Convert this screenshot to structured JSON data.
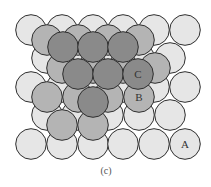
{
  "figure": {
    "caption": "(c)",
    "radius": 15.3,
    "stroke": "#2e2e2e",
    "layers": [
      {
        "name": "A",
        "color": "#e6e6e6",
        "circles": [
          [
            31,
            30
          ],
          [
            62,
            30
          ],
          [
            93,
            30
          ],
          [
            123,
            30
          ],
          [
            154,
            30
          ],
          [
            185,
            30
          ],
          [
            47,
            58
          ],
          [
            77,
            58
          ],
          [
            108,
            58
          ],
          [
            139,
            58
          ],
          [
            170,
            58
          ],
          [
            31,
            87
          ],
          [
            62,
            87
          ],
          [
            93,
            87
          ],
          [
            123,
            87
          ],
          [
            154,
            87
          ],
          [
            185,
            87
          ],
          [
            47,
            115
          ],
          [
            77,
            115
          ],
          [
            108,
            115
          ],
          [
            139,
            115
          ],
          [
            170,
            115
          ],
          [
            31,
            144
          ],
          [
            62,
            144
          ],
          [
            93,
            144
          ],
          [
            123,
            144
          ],
          [
            154,
            144
          ],
          [
            185,
            144
          ]
        ],
        "label": {
          "text": "A",
          "x": 185,
          "y": 148
        }
      },
      {
        "name": "B",
        "color": "#b4b4b4",
        "circles": [
          [
            47,
            40
          ],
          [
            78,
            40
          ],
          [
            108,
            40
          ],
          [
            139,
            40
          ],
          [
            62,
            68
          ],
          [
            93,
            68
          ],
          [
            123,
            68
          ],
          [
            155,
            68
          ],
          [
            47,
            97
          ],
          [
            78,
            97
          ],
          [
            108,
            97
          ],
          [
            139,
            97
          ],
          [
            62,
            125
          ],
          [
            93,
            125
          ]
        ],
        "label": {
          "text": "B",
          "x": 139,
          "y": 101
        }
      },
      {
        "name": "C",
        "color": "#8a8a8a",
        "circles": [
          [
            63,
            47
          ],
          [
            93,
            47
          ],
          [
            123,
            47
          ],
          [
            78,
            74
          ],
          [
            108,
            74
          ],
          [
            138,
            74
          ],
          [
            93,
            102
          ]
        ],
        "label": {
          "text": "C",
          "x": 138,
          "y": 78
        }
      }
    ]
  }
}
